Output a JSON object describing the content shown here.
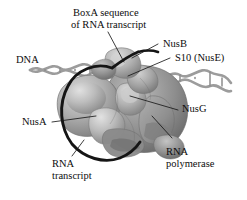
{
  "figure": {
    "background_color": "#ffffff",
    "text_color": "#0d0d0d",
    "font_style": "serif"
  },
  "labels": {
    "boxa_line1": "BoxA sequence",
    "boxa_line2": "of RNA transcript",
    "nusb": "NusB",
    "s10": "S10 (NusE)",
    "nusg": "NusG",
    "rnap_line1": "RNA",
    "rnap_line2": "polymerase",
    "nusa": "NusA",
    "dna": "DNA",
    "rna_line1": "RNA",
    "rna_line2": "transcript"
  },
  "colors": {
    "dna_strand": "#9e9e9e",
    "dna_strand_dark": "#7d7d7d",
    "rna_transcript": "#151515",
    "protein_highlight": "#cfcfcf",
    "protein_mid": "#a6a6a6",
    "protein_shadow": "#7a7a7a",
    "protein_dark": "#5e5e5e",
    "leader_line": "#1a1a1a"
  },
  "components": [
    {
      "name": "BoxA sequence of RNA transcript",
      "kind": "nucleic-acid-segment"
    },
    {
      "name": "NusB",
      "kind": "protein-subunit"
    },
    {
      "name": "S10 (NusE)",
      "kind": "protein-subunit"
    },
    {
      "name": "NusG",
      "kind": "protein-subunit"
    },
    {
      "name": "NusA",
      "kind": "protein-subunit"
    },
    {
      "name": "RNA polymerase",
      "kind": "enzyme"
    },
    {
      "name": "DNA",
      "kind": "double-helix"
    },
    {
      "name": "RNA transcript",
      "kind": "single-strand"
    }
  ]
}
